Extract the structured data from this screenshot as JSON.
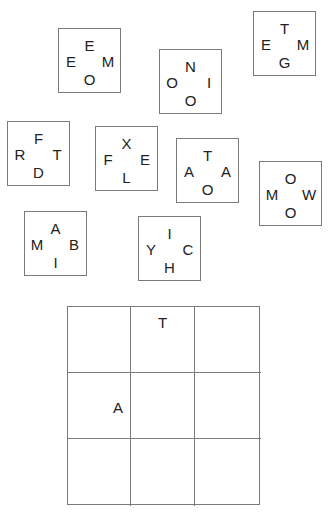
{
  "pieces": [
    {
      "top": "E",
      "left": "E",
      "right": "M",
      "bottom": "O"
    },
    {
      "top": "N",
      "left": "O",
      "right": "I",
      "bottom": "O"
    },
    {
      "top": "T",
      "left": "E",
      "right": "M",
      "bottom": "G"
    },
    {
      "top": "F",
      "left": "R",
      "right": "T",
      "bottom": "D"
    },
    {
      "top": "X",
      "left": "F",
      "right": "E",
      "bottom": "L"
    },
    {
      "top": "T",
      "left": "A",
      "right": "A",
      "bottom": "O"
    },
    {
      "top": "O",
      "left": "M",
      "right": "W",
      "bottom": "O"
    },
    {
      "top": "A",
      "left": "M",
      "right": "B",
      "bottom": "I"
    },
    {
      "top": "I",
      "left": "Y",
      "right": "C",
      "bottom": "H"
    }
  ],
  "board": {
    "rows": 3,
    "cols": 3,
    "cells": [
      [
        {
          "top": "",
          "left": "",
          "right": "",
          "bottom": ""
        },
        {
          "top": "T",
          "left": "",
          "right": "",
          "bottom": ""
        },
        {
          "top": "",
          "left": "",
          "right": "",
          "bottom": ""
        }
      ],
      [
        {
          "top": "",
          "left": "",
          "right": "A",
          "bottom": ""
        },
        {
          "top": "",
          "left": "",
          "right": "",
          "bottom": ""
        },
        {
          "top": "",
          "left": "",
          "right": "",
          "bottom": ""
        }
      ],
      [
        {
          "top": "",
          "left": "",
          "right": "",
          "bottom": ""
        },
        {
          "top": "",
          "left": "",
          "right": "",
          "bottom": ""
        },
        {
          "top": "",
          "left": "",
          "right": "",
          "bottom": ""
        }
      ]
    ]
  }
}
